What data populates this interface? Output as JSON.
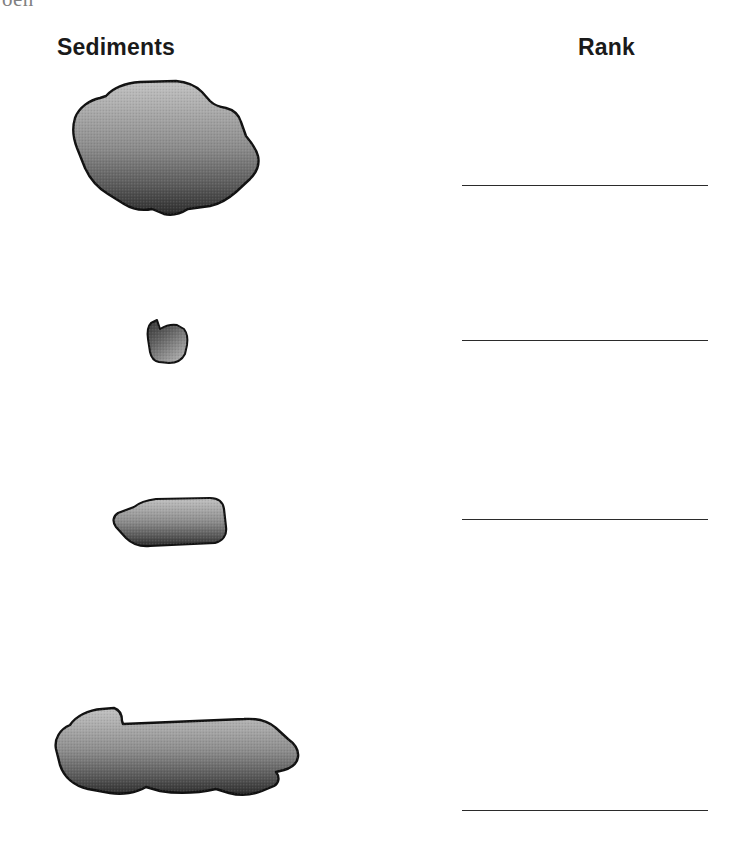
{
  "page": {
    "background_color": "#ffffff",
    "width": 738,
    "height": 854,
    "top_edge_artifact": "oen"
  },
  "headers": {
    "sediments": "Sediments",
    "rank": "Rank"
  },
  "colors": {
    "ink": "#1a1a1a",
    "rule_line": "#2b2b2b",
    "rock_light": "#b4b4b4",
    "rock_mid": "#7d7d7d",
    "rock_dark": "#2f2f2f",
    "rock_outline": "#111111"
  },
  "specimens": [
    {
      "index": 1,
      "name": "large-rounded-pebble",
      "description": "large irregular rounded clast, widest of the set",
      "shading": "top-light to bottom-dark gradient with halftone texture"
    },
    {
      "index": 2,
      "name": "small-angular-pebble",
      "description": "small angular clast with notch on upper left",
      "shading": "top-dark to bottom-light gradient with halftone texture"
    },
    {
      "index": 3,
      "name": "elongate-tapered-clast",
      "description": "elongate horizontal wedge tapering to the left",
      "shading": "top-light to bottom-dark gradient with halftone texture"
    },
    {
      "index": 4,
      "name": "large-elongate-clast",
      "description": "long irregular clast with a shoulder step on the upper left",
      "shading": "top-light to bottom-dark gradient with halftone texture"
    }
  ],
  "rank_lines": [
    {
      "index": 1,
      "value": ""
    },
    {
      "index": 2,
      "value": ""
    },
    {
      "index": 3,
      "value": ""
    },
    {
      "index": 4,
      "value": ""
    }
  ]
}
